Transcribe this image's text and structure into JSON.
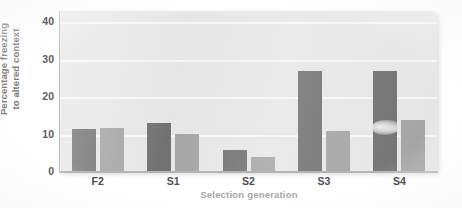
{
  "chart_data": {
    "type": "bar",
    "title": "",
    "subtitle": "",
    "xlabel": "Selection generation",
    "ylabel_lines": [
      "Percentage freezing",
      "to altered context"
    ],
    "ylabel": "Percentage freezing to altered context",
    "categories": [
      "F2",
      "S1",
      "S2",
      "S3",
      "S4"
    ],
    "series": [
      {
        "name": "dark",
        "color": "#6f6f6f",
        "values": [
          11.5,
          13.0,
          6.0,
          27.0,
          27.0
        ]
      },
      {
        "name": "light",
        "color": "#a3a3a3",
        "values": [
          11.7,
          10.2,
          4.0,
          11.0,
          14.0
        ]
      }
    ],
    "yticks": [
      0,
      10,
      20,
      30,
      40
    ],
    "ylim": [
      0,
      43
    ],
    "grid": true,
    "grid_axis": "y",
    "legend": "none",
    "plot_background": "#e6e6e6",
    "gridline_color": "#f7f7f7",
    "annotations": [
      {
        "name": "scan-smudge",
        "on_category": "S4",
        "on_series": "dark",
        "value_center": 12.0
      }
    ]
  }
}
